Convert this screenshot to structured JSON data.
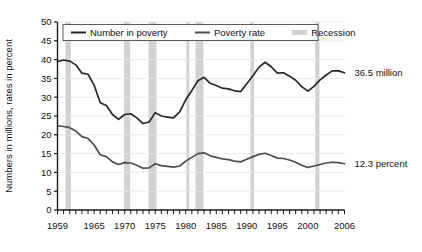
{
  "chart_data": {
    "type": "line",
    "title": "",
    "xlabel": "",
    "ylabel": "Numbers in millions, rates in percent",
    "xlim": [
      1959,
      2006
    ],
    "ylim": [
      0,
      50
    ],
    "grid": true,
    "legend_position": "top-left-inside",
    "x": [
      1959,
      1960,
      1961,
      1962,
      1963,
      1964,
      1965,
      1966,
      1967,
      1968,
      1969,
      1970,
      1971,
      1972,
      1973,
      1974,
      1975,
      1976,
      1977,
      1978,
      1979,
      1980,
      1981,
      1982,
      1983,
      1984,
      1985,
      1986,
      1987,
      1988,
      1989,
      1990,
      1991,
      1992,
      1993,
      1994,
      1995,
      1996,
      1997,
      1998,
      1999,
      2000,
      2001,
      2002,
      2003,
      2004,
      2005,
      2006
    ],
    "xticks": [
      1959,
      1965,
      1970,
      1975,
      1980,
      1985,
      1990,
      1995,
      2000,
      2006
    ],
    "xtick_labels": [
      "1959",
      "1965",
      "1970",
      "1975",
      "1980",
      "1985",
      "1990",
      "1995",
      "2000",
      "2006"
    ],
    "yticks": [
      0,
      5,
      10,
      15,
      20,
      25,
      30,
      35,
      40,
      45,
      50
    ],
    "ytick_labels": [
      "0",
      "5",
      "10",
      "15",
      "20",
      "25",
      "30",
      "35",
      "40",
      "45",
      "50"
    ],
    "series": [
      {
        "name": "Number in poverty",
        "units": "millions",
        "color": "#262626",
        "end_label": "36.5 million",
        "values": [
          39.5,
          39.9,
          39.6,
          38.6,
          36.4,
          36.1,
          33.2,
          28.5,
          27.8,
          25.4,
          24.1,
          25.4,
          25.6,
          24.5,
          23.0,
          23.4,
          25.9,
          25.0,
          24.7,
          24.5,
          26.1,
          29.3,
          31.8,
          34.4,
          35.3,
          33.7,
          33.1,
          32.4,
          32.2,
          31.7,
          31.5,
          33.6,
          35.7,
          38.0,
          39.3,
          38.1,
          36.4,
          36.5,
          35.6,
          34.5,
          32.8,
          31.6,
          32.9,
          34.6,
          35.9,
          37.0,
          37.0,
          36.5
        ]
      },
      {
        "name": "Poverty rate",
        "units": "percent",
        "color": "#4d4d4d",
        "end_label": "12.3 percent",
        "values": [
          22.4,
          22.2,
          21.9,
          21.0,
          19.5,
          19.0,
          17.3,
          14.7,
          14.2,
          12.8,
          12.1,
          12.6,
          12.5,
          11.9,
          11.1,
          11.2,
          12.3,
          11.8,
          11.6,
          11.4,
          11.7,
          13.0,
          14.0,
          15.0,
          15.2,
          14.4,
          14.0,
          13.6,
          13.4,
          13.0,
          12.8,
          13.5,
          14.2,
          14.8,
          15.1,
          14.5,
          13.8,
          13.7,
          13.3,
          12.7,
          11.9,
          11.3,
          11.7,
          12.1,
          12.5,
          12.7,
          12.6,
          12.3
        ]
      }
    ],
    "recessions": [
      {
        "label": "Recession",
        "start": 1960.3,
        "end": 1961.2
      },
      {
        "label": "Recession",
        "start": 1969.9,
        "end": 1970.9
      },
      {
        "label": "Recession",
        "start": 1973.9,
        "end": 1975.2
      },
      {
        "label": "Recession",
        "start": 1980.1,
        "end": 1980.6
      },
      {
        "label": "Recession",
        "start": 1981.6,
        "end": 1982.9
      },
      {
        "label": "Recession",
        "start": 1990.6,
        "end": 1991.2
      },
      {
        "label": "Recession",
        "start": 2001.2,
        "end": 2001.9
      }
    ],
    "recession_color": "#d2d2d2",
    "grid_color": "#e6e6e6",
    "axis_color": "#1a1a1a",
    "legend": [
      {
        "label": "Number in poverty",
        "marker": "line",
        "color": "#262626"
      },
      {
        "label": "Poverty rate",
        "marker": "line",
        "color": "#4d4d4d"
      },
      {
        "label": "Recession",
        "marker": "swatch",
        "color": "#d2d2d2"
      }
    ]
  }
}
